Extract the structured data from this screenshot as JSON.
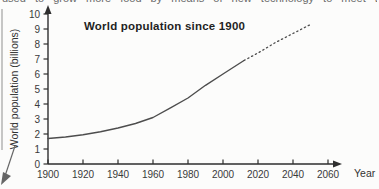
{
  "page": {
    "background": "#fcfcfb",
    "top_clipped_text": "used to grow more food by means of new technology to meet the needs of a growing population"
  },
  "decorations": {
    "left_rule_color": "#b8b8b8",
    "corner_arrow_color": "#666666"
  },
  "chart_data": {
    "type": "line",
    "title": "World population since 1900",
    "xlabel": "Year",
    "ylabel": "World population (billions)",
    "x_ticks": [
      1900,
      1920,
      1940,
      1960,
      1980,
      2000,
      2020,
      2040,
      2060
    ],
    "y_ticks": [
      0,
      1,
      2,
      3,
      4,
      5,
      6,
      7,
      8,
      9,
      10
    ],
    "xlim": [
      1900,
      2068
    ],
    "ylim": [
      0,
      10.5
    ],
    "grid": false,
    "legend": "none",
    "axis_color": "#2e2e2e",
    "line_color": "#4d4d4d",
    "series": [
      {
        "name": "observed (solid line)",
        "style": "solid",
        "x": [
          1900,
          1910,
          1920,
          1930,
          1940,
          1950,
          1960,
          1970,
          1980,
          1990,
          2000,
          2012
        ],
        "y": [
          1.7,
          1.8,
          1.95,
          2.15,
          2.4,
          2.7,
          3.1,
          3.75,
          4.4,
          5.25,
          6.0,
          6.9
        ]
      },
      {
        "name": "projection (dotted line)",
        "style": "dotted",
        "x": [
          2012,
          2020,
          2030,
          2040,
          2050
        ],
        "y": [
          6.9,
          7.4,
          8.1,
          8.7,
          9.3
        ]
      }
    ]
  }
}
